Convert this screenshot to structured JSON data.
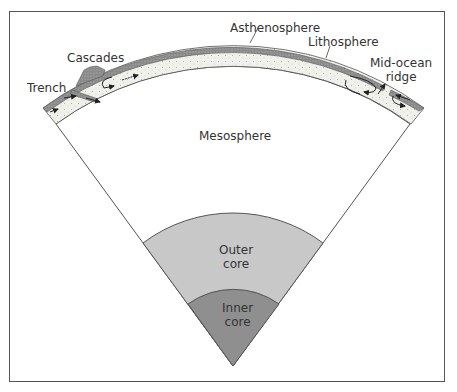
{
  "diagram": {
    "type": "earth-interior-cross-section",
    "labels": {
      "asthenosphere": "Asthenosphere",
      "lithosphere": "Lithosphere",
      "cascades": "Cascades",
      "trench": "Trench",
      "mid_ocean_ridge_1": "Mid-ocean",
      "mid_ocean_ridge_2": "ridge",
      "mesosphere": "Mesosphere",
      "outer_core_1": "Outer",
      "outer_core_2": "core",
      "inner_core_1": "Inner",
      "inner_core_2": "core"
    },
    "colors": {
      "lithosphere": "#8a8a8a",
      "asthenosphere": "#f1f1ec",
      "mesosphere": "#ffffff",
      "outer_core": "#c8c8c8",
      "inner_core": "#8f8f8f",
      "outline": "#555555"
    }
  }
}
